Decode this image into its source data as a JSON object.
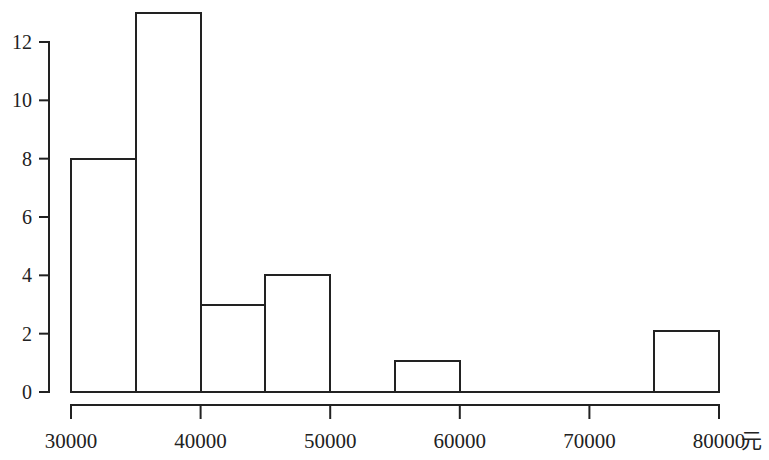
{
  "chart_data": {
    "type": "bar",
    "title": "",
    "subtitle": "",
    "xlabel": "元",
    "ylabel": "",
    "grid": false,
    "legend": null,
    "xlim": [
      30000,
      80000
    ],
    "ylim": [
      0,
      13.4
    ],
    "bin_width": 5000,
    "x_tick_values": [
      30000,
      40000,
      50000,
      60000,
      70000,
      80000
    ],
    "x_tick_labels": [
      "30000",
      "40000",
      "50000",
      "60000",
      "70000",
      "80000"
    ],
    "y_tick_values": [
      0,
      2,
      4,
      6,
      8,
      10,
      12
    ],
    "y_tick_labels": [
      "0",
      "2",
      "4",
      "6",
      "8",
      "10",
      "12"
    ],
    "bins": [
      {
        "start": 30000,
        "end": 35000,
        "value": 8
      },
      {
        "start": 35000,
        "end": 40000,
        "value": 13
      },
      {
        "start": 40000,
        "end": 45000,
        "value": 3
      },
      {
        "start": 45000,
        "end": 50000,
        "value": 4
      },
      {
        "start": 50000,
        "end": 55000,
        "value": 0
      },
      {
        "start": 55000,
        "end": 60000,
        "value": 1.05
      },
      {
        "start": 60000,
        "end": 65000,
        "value": 0
      },
      {
        "start": 65000,
        "end": 70000,
        "value": 0
      },
      {
        "start": 70000,
        "end": 75000,
        "value": 0
      },
      {
        "start": 75000,
        "end": 80000,
        "value": 2.1
      }
    ],
    "categories": [
      "30000-35000",
      "35000-40000",
      "40000-45000",
      "45000-50000",
      "50000-55000",
      "55000-60000",
      "60000-65000",
      "65000-70000",
      "70000-75000",
      "75000-80000"
    ],
    "values": [
      8,
      13,
      3,
      4,
      0,
      1.05,
      0,
      0,
      0,
      2.1
    ],
    "colors": {
      "axis": "#222222",
      "bar_stroke": "#222222",
      "bar_fill": "#ffffff",
      "background": "#ffffff"
    }
  }
}
